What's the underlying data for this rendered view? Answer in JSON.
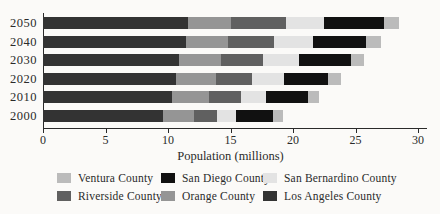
{
  "chart_data": {
    "type": "bar",
    "orientation": "horizontal",
    "stacked": true,
    "title": "",
    "xlabel": "Population (millions)",
    "ylabel": "",
    "xlim": [
      0,
      30
    ],
    "x_ticks": [
      0,
      5,
      10,
      15,
      20,
      25,
      30
    ],
    "grid": false,
    "categories": [
      "2050",
      "2040",
      "2030",
      "2020",
      "2010",
      "2000"
    ],
    "series": [
      {
        "name": "Los Angeles County",
        "color": "#333333",
        "values": [
          11.6,
          11.4,
          10.9,
          10.6,
          10.3,
          9.6
        ]
      },
      {
        "name": "Orange County",
        "color": "#959595",
        "values": [
          3.4,
          3.4,
          3.3,
          3.2,
          3.0,
          2.5
        ]
      },
      {
        "name": "Riverside County",
        "color": "#606060",
        "values": [
          4.4,
          3.7,
          3.4,
          2.9,
          2.5,
          1.8
        ]
      },
      {
        "name": "San Bernardino County",
        "color": "#e3e3e3",
        "values": [
          3.1,
          3.1,
          2.9,
          2.6,
          2.0,
          1.5
        ]
      },
      {
        "name": "San Diego County",
        "color": "#111111",
        "values": [
          4.8,
          4.2,
          4.1,
          3.5,
          3.4,
          3.0
        ]
      },
      {
        "name": "Ventura County",
        "color": "#bbbbbb",
        "values": [
          1.2,
          1.2,
          1.1,
          1.0,
          0.9,
          0.8
        ]
      }
    ],
    "totals": [
      28.5,
      27.0,
      25.7,
      23.8,
      22.1,
      19.2
    ],
    "legend": {
      "position": "bottom",
      "items": [
        {
          "label": "Ventura County"
        },
        {
          "label": "San Diego County"
        },
        {
          "label": "San Bernardino County"
        },
        {
          "label": "Riverside County"
        },
        {
          "label": "Orange County"
        },
        {
          "label": "Los Angeles County"
        }
      ]
    },
    "axis_color": "#2a2a2a",
    "background_color": "#fbfaf8"
  }
}
